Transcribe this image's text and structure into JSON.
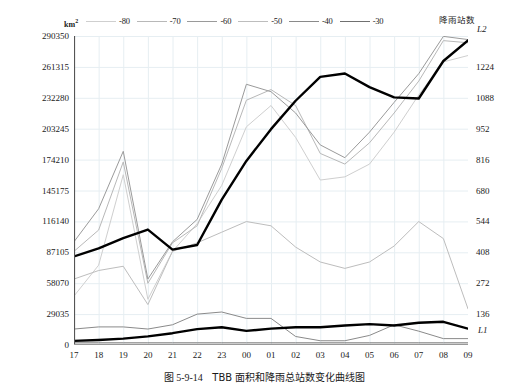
{
  "caption": {
    "figure_number": "图 5-9-14",
    "text": "TBB 面积和降雨总站数变化曲线图"
  },
  "axis": {
    "left_unit": "km",
    "left_unit_sup": "2",
    "left_ticks": [
      "290350",
      "261315",
      "232280",
      "203245",
      "174210",
      "145175",
      "116140",
      "87105",
      "58070",
      "29035",
      "0"
    ],
    "right_ticks": [
      "1224",
      "1088",
      "952",
      "816",
      "680",
      "544",
      "408",
      "272",
      "136"
    ],
    "x_ticks": [
      "17",
      "18",
      "19",
      "20",
      "21",
      "22",
      "23",
      "00",
      "01",
      "02",
      "03",
      "04",
      "05",
      "06",
      "07",
      "08",
      "09"
    ]
  },
  "annotations": {
    "rain_station_label": "降雨站数",
    "l2_label": "L2",
    "l1_label": "L1"
  },
  "legend": {
    "items": [
      {
        "label": "-80",
        "color": "#cfcfcf"
      },
      {
        "label": "-70",
        "color": "#b8b8b8"
      },
      {
        "label": "-60",
        "color": "#9a9a9a"
      },
      {
        "label": "-50",
        "color": "#bdbdbd"
      },
      {
        "label": "-40",
        "color": "#8a8a8a"
      },
      {
        "label": "-30",
        "color": "#707070"
      }
    ]
  },
  "chart_data": {
    "type": "line",
    "title": "TBB 面积和降雨总站数变化曲线图",
    "xlabel": "",
    "ylabel": "km2",
    "ylabel_right": "降雨站数",
    "x": [
      "17",
      "18",
      "19",
      "20",
      "21",
      "22",
      "23",
      "00",
      "01",
      "02",
      "03",
      "04",
      "05",
      "06",
      "07",
      "08",
      "09"
    ],
    "ylim": [
      0,
      290350
    ],
    "ylim_right": [
      0,
      1360
    ],
    "grid": true,
    "legend_position": "top",
    "series": [
      {
        "name": "-80",
        "axis": "left",
        "color": "#cfcfcf",
        "width": 1.0,
        "values": [
          46000,
          75000,
          160000,
          43000,
          88000,
          114000,
          150000,
          205000,
          225000,
          195000,
          155000,
          158000,
          170000,
          200000,
          235000,
          266000,
          272000
        ]
      },
      {
        "name": "-70",
        "axis": "left",
        "color": "#b8b8b8",
        "width": 1.0,
        "values": [
          88000,
          108000,
          172000,
          58000,
          96000,
          112000,
          166000,
          230000,
          240000,
          225000,
          180000,
          170000,
          190000,
          218000,
          248000,
          286000,
          284000
        ]
      },
      {
        "name": "-60",
        "axis": "left",
        "color": "#9a9a9a",
        "width": 1.0,
        "values": [
          97000,
          128000,
          182000,
          62000,
          97000,
          118000,
          170000,
          245000,
          238000,
          218000,
          188000,
          176000,
          200000,
          228000,
          255000,
          290000,
          287000
        ]
      },
      {
        "name": "-50",
        "axis": "left",
        "color": "#bdbdbd",
        "width": 1.0,
        "values": [
          62000,
          70000,
          74000,
          38000,
          88000,
          96000,
          106000,
          116000,
          112000,
          92000,
          78000,
          72000,
          78000,
          93000,
          116000,
          100000,
          34000
        ]
      },
      {
        "name": "-40",
        "axis": "left",
        "color": "#8a8a8a",
        "width": 1.0,
        "values": [
          15000,
          17000,
          17000,
          15000,
          19000,
          29000,
          31000,
          25000,
          25000,
          8000,
          4000,
          4000,
          9000,
          19000,
          13000,
          6000,
          6000
        ]
      },
      {
        "name": "-30",
        "axis": "left",
        "color": "#707070",
        "width": 1.0,
        "values": [
          2000,
          2000,
          2000,
          2000,
          2000,
          2000,
          2000,
          2000,
          2000,
          2000,
          2000,
          2000,
          2000,
          2000,
          2000,
          2000,
          2000
        ]
      },
      {
        "name": "L2",
        "axis": "right",
        "color": "#000000",
        "width": 2.4,
        "label": "L2",
        "values": [
          390,
          425,
          470,
          508,
          420,
          440,
          640,
          810,
          950,
          1075,
          1180,
          1195,
          1135,
          1090,
          1085,
          1250,
          1340
        ]
      },
      {
        "name": "L1",
        "axis": "right",
        "color": "#000000",
        "width": 2.4,
        "label": "L1",
        "values": [
          18,
          22,
          28,
          38,
          52,
          70,
          78,
          62,
          72,
          78,
          78,
          86,
          92,
          86,
          98,
          102,
          72
        ]
      }
    ]
  }
}
